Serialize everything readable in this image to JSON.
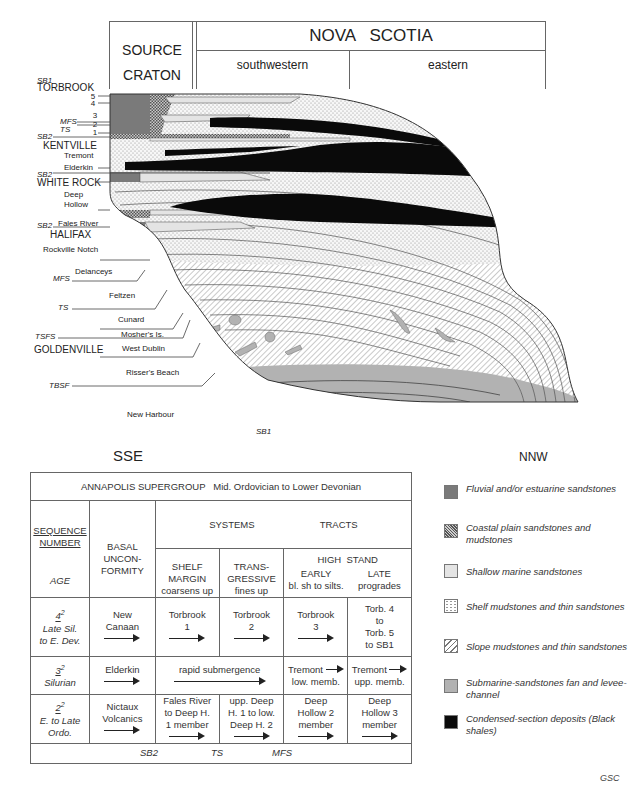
{
  "header": {
    "source_craton": [
      "SOURCE",
      "CRATON"
    ],
    "region": "NOVA   SCOTIA",
    "subregions": [
      "southwestern",
      "eastern"
    ]
  },
  "directions": {
    "left": "SSE",
    "right": "NNW"
  },
  "left_labels": [
    {
      "text": "SB1",
      "italic": true
    },
    {
      "text": "TORBROOK",
      "italic": false,
      "caps": true
    },
    {
      "text": "5",
      "italic": false
    },
    {
      "text": "4",
      "italic": false
    },
    {
      "text": "3",
      "italic": false
    },
    {
      "text": "MFS",
      "italic": true
    },
    {
      "text": "2",
      "italic": false
    },
    {
      "text": "TS",
      "italic": true
    },
    {
      "text": "1",
      "italic": false
    },
    {
      "text": "SB2",
      "italic": true
    },
    {
      "text": "KENTVILLE",
      "italic": false,
      "caps": true
    },
    {
      "text": "Tremont",
      "italic": false
    },
    {
      "text": "Elderkin",
      "italic": false
    },
    {
      "text": "SB2",
      "italic": true
    },
    {
      "text": "WHITE ROCK",
      "italic": false,
      "caps": true
    },
    {
      "text": "Deep",
      "italic": false
    },
    {
      "text": "Hollow",
      "italic": false
    },
    {
      "text": "SB2",
      "italic": true
    },
    {
      "text": "Fales River",
      "italic": false
    },
    {
      "text": "HALIFAX",
      "italic": false,
      "caps": true
    },
    {
      "text": "Rockville Notch",
      "italic": false
    },
    {
      "text": "Delanceys",
      "italic": false
    },
    {
      "text": "MFS",
      "italic": true
    },
    {
      "text": "Feltzen",
      "italic": false
    },
    {
      "text": "TS",
      "italic": true
    },
    {
      "text": "Cunard",
      "italic": false
    },
    {
      "text": "TSFS",
      "italic": true
    },
    {
      "text": "Mosher's Is.",
      "italic": false
    },
    {
      "text": "GOLDENVILLE",
      "italic": false,
      "caps": true
    },
    {
      "text": "West Dublin",
      "italic": false
    },
    {
      "text": "Risser's Beach",
      "italic": false
    },
    {
      "text": "TBSF",
      "italic": true
    },
    {
      "text": "New Harbour",
      "italic": false
    },
    {
      "text": "SB1",
      "italic": true
    }
  ],
  "table": {
    "title": "ANNAPOLIS SUPERGROUP   Mid. Ordovician to Lower Devonian",
    "col1_head": [
      "SEQUENCE",
      "NUMBER"
    ],
    "col1_sub": "AGE",
    "col2_head": [
      "BASAL",
      "UNCON-",
      "FORMITY"
    ],
    "systems_tracts": [
      "SYSTEMS",
      "TRACTS"
    ],
    "high_stand": "HIGH  STAND",
    "subheads": [
      {
        "lines": [
          "SHELF",
          "MARGIN",
          "coarsens up"
        ]
      },
      {
        "lines": [
          "TRANS-",
          "GRESSIVE",
          "fines up"
        ]
      },
      {
        "lines": [
          "EARLY",
          "bl. sh to silts."
        ]
      },
      {
        "lines": [
          "LATE",
          "progrades"
        ]
      }
    ],
    "rows": [
      {
        "seq": "4",
        "sup": "2",
        "age": [
          "Late Sil.",
          "to E. Dev."
        ],
        "unconformity": [
          "New",
          "Canaan"
        ],
        "shelf": [
          "Torbrook",
          "1"
        ],
        "trans": [
          "Torbrook",
          "2"
        ],
        "early": [
          "Torbrook",
          "3"
        ],
        "late": [
          "Torb. 4",
          "to",
          "Torb. 5",
          "to SB1"
        ]
      },
      {
        "seq": "3",
        "sup": "2",
        "age": [
          "Silurian"
        ],
        "unconformity": [
          "Elderkin"
        ],
        "shelf_trans": "rapid submergence",
        "early": [
          "Tremont",
          "low. memb."
        ],
        "late": [
          "Tremont",
          "upp. memb."
        ]
      },
      {
        "seq": "2",
        "sup": "2",
        "age": [
          "E. to Late",
          "Ordo."
        ],
        "unconformity": [
          "Nictaux",
          "Volcanics"
        ],
        "shelf": [
          "Fales River",
          "to Deep H.",
          "1 member"
        ],
        "trans": [
          "upp. Deep",
          "H. 1 to low.",
          "Deep H. 2"
        ],
        "early": [
          "Deep",
          "Hollow 2",
          "member"
        ],
        "late": [
          "Deep",
          "Hollow 3",
          "member"
        ]
      }
    ],
    "boundaries": [
      "SB2",
      "TS",
      "MFS"
    ]
  },
  "legend": [
    {
      "key": "fluvial",
      "label": "Fluvial and/or estuarine sandstones",
      "color": "#7a7a7a"
    },
    {
      "key": "coastal",
      "label": "Coastal plain sandstones and mudstones",
      "color": "#9a9a9a"
    },
    {
      "key": "shallow",
      "label": "Shallow marine sandstones",
      "color": "#e4e4e4"
    },
    {
      "key": "shelf",
      "label": "Shelf mudstones and thin sandstones",
      "color": "#f4f4f4"
    },
    {
      "key": "slope",
      "label": "Slope mudstones and thin sandstones",
      "color": "#ffffff"
    },
    {
      "key": "submarine",
      "label": "Submarine-sandstones fan and levee-channel",
      "color": "#b2b2b2"
    },
    {
      "key": "condensed",
      "label": "Condensed-section deposits (Black shales)",
      "color": "#0a0a0a"
    }
  ],
  "credit": "GSC"
}
